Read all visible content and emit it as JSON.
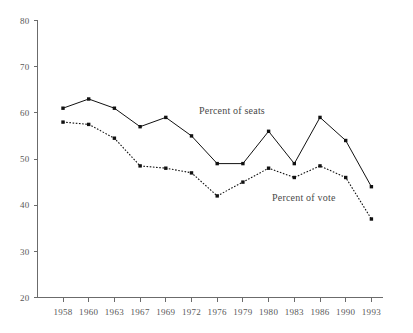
{
  "chart_data": {
    "type": "line",
    "title": "",
    "subtitle": "",
    "xlabel": "",
    "ylabel": "",
    "categories": [
      "1958",
      "1960",
      "1963",
      "1967",
      "1969",
      "1972",
      "1976",
      "1979",
      "1980",
      "1983",
      "1986",
      "1990",
      "1993"
    ],
    "series": [
      {
        "name": "Percent of seats",
        "style": "solid",
        "values": [
          61,
          63,
          61,
          57,
          59,
          55,
          49,
          49,
          56,
          49,
          59,
          54,
          44
        ]
      },
      {
        "name": "Percent of vote",
        "style": "dotted",
        "values": [
          58,
          57.5,
          54.5,
          48.5,
          48,
          47,
          42,
          45,
          48,
          46,
          48.5,
          46,
          37
        ]
      }
    ],
    "ylim": [
      20,
      80
    ],
    "yticks": [
      20,
      30,
      40,
      50,
      60,
      70,
      80
    ],
    "ytick_labels": [
      "20",
      "30",
      "40",
      "50",
      "60",
      "70",
      "80"
    ],
    "grid": false,
    "legend_position": "inline-annotations",
    "annotations": [
      {
        "name": "seats-label",
        "text": "Percent of seats",
        "x": 1972,
        "y": 60
      },
      {
        "name": "vote-label",
        "text": "Percent of vote",
        "x": 1983,
        "y": 41
      }
    ],
    "colors": {
      "line": "#111111",
      "marker": "#111111",
      "axis": "#6b6b6b",
      "tick_text": "#585858",
      "annotation_text": "#4a4a4a",
      "background": "#ffffff"
    }
  }
}
